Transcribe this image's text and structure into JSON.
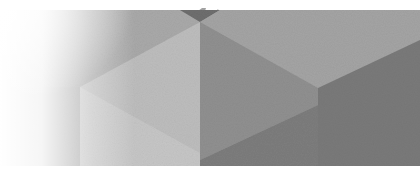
{
  "image": {
    "description": "Abstract grayscale isometric cube pattern with white fade on the left",
    "colors": {
      "background": "#ffffff",
      "top_left_face": "#a9a9a9",
      "top_face_center": "#9c9c9c",
      "top_face_right": "#a4a4a4",
      "left_face_light": "#bdbdbd",
      "front_face_lower_left": "#c6c6c6",
      "center_face": "#909090",
      "lower_center_face": "#7d7d7d",
      "right_face": "#7a7a7a",
      "apex_dark": "#6e6e6e",
      "top_fragment": "#8a8a8a"
    }
  }
}
